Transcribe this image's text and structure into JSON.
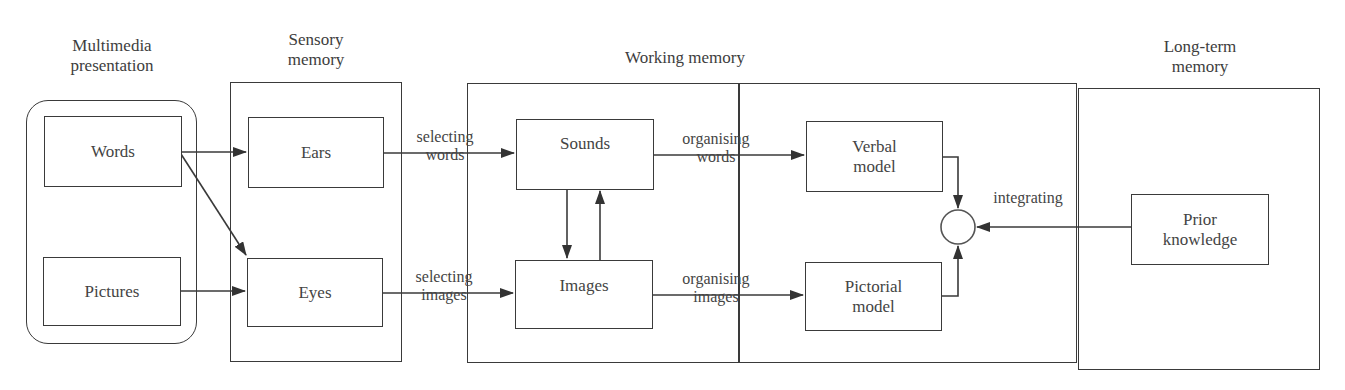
{
  "diagram": {
    "columns": [
      {
        "id": "multimedia",
        "title_line1": "Multimedia",
        "title_line2": "presentation"
      },
      {
        "id": "sensory",
        "title_line1": "Sensory",
        "title_line2": "memory"
      },
      {
        "id": "working",
        "title_line1": "Working memory"
      },
      {
        "id": "longterm",
        "title_line1": "Long-term",
        "title_line2": "memory"
      }
    ],
    "nodes": {
      "words": {
        "label": "Words"
      },
      "pictures": {
        "label": "Pictures"
      },
      "ears": {
        "label": "Ears"
      },
      "eyes": {
        "label": "Eyes"
      },
      "sounds": {
        "label": "Sounds"
      },
      "images": {
        "label": "Images"
      },
      "verbal": {
        "line1": "Verbal",
        "line2": "model"
      },
      "pictorial": {
        "line1": "Pictorial",
        "line2": "model"
      },
      "prior": {
        "line1": "Prior",
        "line2": "knowledge"
      }
    },
    "edge_labels": {
      "selecting_words": {
        "line1": "selecting",
        "line2": "words"
      },
      "selecting_images": {
        "line1": "selecting",
        "line2": "images"
      },
      "organising_words": {
        "line1": "organising",
        "line2": "words"
      },
      "organising_images": {
        "line1": "organising",
        "line2": "images"
      },
      "integrating": {
        "line1": "integrating"
      }
    },
    "edges": [
      {
        "from": "words",
        "to": "ears"
      },
      {
        "from": "words",
        "to": "eyes"
      },
      {
        "from": "pictures",
        "to": "eyes"
      },
      {
        "from": "ears",
        "to": "sounds",
        "label": "selecting words"
      },
      {
        "from": "eyes",
        "to": "images",
        "label": "selecting images"
      },
      {
        "from": "sounds",
        "to": "images"
      },
      {
        "from": "images",
        "to": "sounds"
      },
      {
        "from": "sounds",
        "to": "verbal",
        "label": "organising words"
      },
      {
        "from": "images",
        "to": "pictorial",
        "label": "organising images"
      },
      {
        "from": "verbal",
        "to": "integration-node"
      },
      {
        "from": "pictorial",
        "to": "integration-node"
      },
      {
        "from": "prior",
        "to": "integration-node",
        "label": "integrating"
      }
    ],
    "colors": {
      "line": "#3a3a3a",
      "text": "#444444",
      "background": "#ffffff"
    }
  }
}
